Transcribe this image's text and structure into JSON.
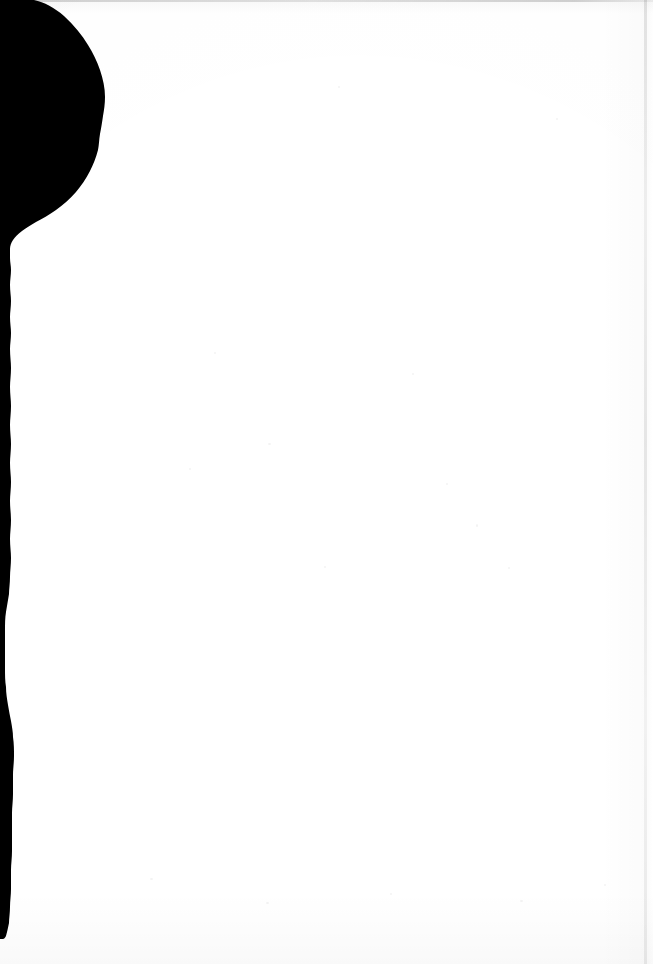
{
  "page": {
    "kind": "scanned-page",
    "width": 653,
    "height": 964,
    "background_color": "#ffffff",
    "visible_text": ""
  },
  "marks": {
    "ink_color": "#000000",
    "ink_mass_label": "",
    "top_edge_line_label": "",
    "right_edge_line_label": "",
    "bottom_wash_label": ""
  },
  "content": {
    "headings": [],
    "paragraphs": [],
    "captions": [],
    "figures": [],
    "tables": []
  }
}
